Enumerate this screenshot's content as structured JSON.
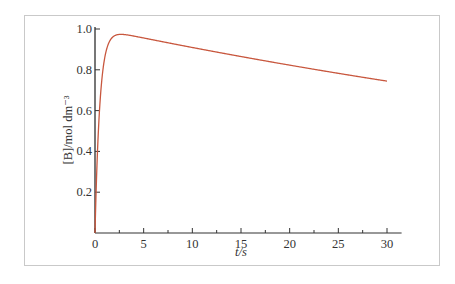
{
  "chart_data": {
    "type": "line",
    "title": "",
    "xlabel": "t/s",
    "ylabel": "[B]/mol dm⁻³",
    "xlim": [
      0,
      31.5
    ],
    "ylim": [
      0,
      1.0
    ],
    "x_ticks": [
      0,
      5,
      10,
      15,
      20,
      25,
      30
    ],
    "x_tick_labels": [
      "0",
      "5",
      "10",
      "15",
      "20",
      "25",
      "30"
    ],
    "x_minor_ticks": [
      2.5,
      7.5,
      12.5,
      17.5,
      22.5,
      27.5
    ],
    "y_ticks": [
      0.2,
      0.4,
      0.6,
      0.8,
      1.0
    ],
    "y_tick_labels": [
      "0.2",
      "0.4",
      "0.6",
      "0.8",
      "1.0"
    ],
    "grid": false,
    "legend": null,
    "series": [
      {
        "name": "[B]",
        "color": "#c8573e",
        "model": "consecutive reaction A→B→C, k1≈2 s⁻¹, k2≈0.01 s⁻¹",
        "x": [
          0,
          0.1,
          0.2,
          0.3,
          0.5,
          0.75,
          1.0,
          1.5,
          2.0,
          2.5,
          3,
          5,
          10,
          15,
          20,
          25,
          30
        ],
        "values": [
          0,
          0.18,
          0.33,
          0.45,
          0.63,
          0.77,
          0.86,
          0.94,
          0.96,
          0.97,
          0.97,
          0.95,
          0.905,
          0.86,
          0.82,
          0.78,
          0.74
        ]
      }
    ]
  }
}
